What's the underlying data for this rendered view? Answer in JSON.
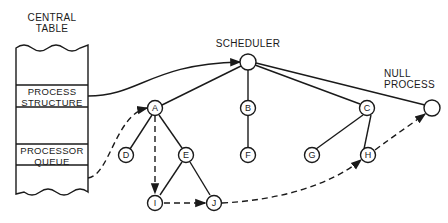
{
  "central_table": {
    "title_line1": "CENTRAL",
    "title_line2": "TABLE",
    "rows": [
      {
        "line1": "PROCESS",
        "line2": "STRUCTURE"
      },
      {
        "line1": "PROCESSOR",
        "line2": "QUEUE"
      }
    ]
  },
  "labels": {
    "scheduler": "SCHEDULER",
    "null_process_line1": "NULL",
    "null_process_line2": "PROCESS"
  },
  "nodes": {
    "A": "A",
    "B": "B",
    "C": "C",
    "D": "D",
    "E": "E",
    "F": "F",
    "G": "G",
    "H": "H",
    "I": "I",
    "J": "J"
  },
  "colors": {
    "ink": "#1a1a1a",
    "background": "#ffffff"
  }
}
